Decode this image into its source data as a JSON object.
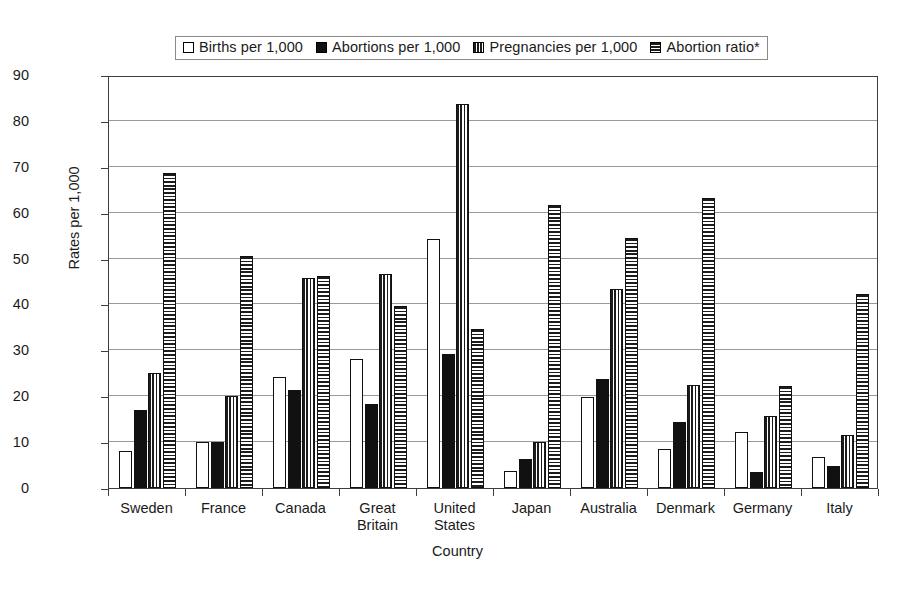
{
  "chart_data": {
    "type": "bar",
    "title": "",
    "xlabel": "Country",
    "ylabel": "Rates per 1,000",
    "ylim": [
      0,
      90
    ],
    "ytick_step": 10,
    "yticks": [
      0,
      10,
      20,
      30,
      40,
      50,
      60,
      70,
      80,
      90
    ],
    "grid": true,
    "legend_position": "top-center",
    "categories": [
      "Sweden",
      "France",
      "Canada",
      "Great\nBritain",
      "United\nStates",
      "Japan",
      "Australia",
      "Denmark",
      "Germany",
      "Italy"
    ],
    "series": [
      {
        "name": "Births per 1,000",
        "pattern": "open",
        "values": [
          8.0,
          10.0,
          24.2,
          28.2,
          54.3,
          3.8,
          19.8,
          8.5,
          12.2,
          6.7
        ]
      },
      {
        "name": "Abortions per 1,000",
        "pattern": "solid-black",
        "values": [
          17.1,
          10.0,
          21.3,
          18.3,
          29.3,
          6.3,
          23.8,
          14.4,
          3.5,
          4.9
        ]
      },
      {
        "name": "Pregnancies per 1,000",
        "pattern": "vertical-stripes",
        "values": [
          25.0,
          20.0,
          45.7,
          46.6,
          83.7,
          10.1,
          43.4,
          22.5,
          15.7,
          11.6
        ]
      },
      {
        "name": "Abortion ratio*",
        "pattern": "horizontal-stripes",
        "values": [
          68.6,
          50.5,
          46.3,
          39.7,
          34.7,
          61.6,
          54.5,
          63.3,
          22.2,
          42.2
        ]
      }
    ]
  },
  "legend": {
    "entries": [
      {
        "label": "Births per 1,000",
        "pattern": "open"
      },
      {
        "label": "Abortions per 1,000",
        "pattern": "solid-black"
      },
      {
        "label": "Pregnancies per 1,000",
        "pattern": "vertical-stripes"
      },
      {
        "label": "Abortion ratio*",
        "pattern": "horizontal-stripes"
      }
    ]
  }
}
